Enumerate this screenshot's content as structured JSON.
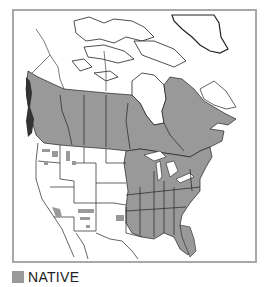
{
  "map": {
    "title": "",
    "region": "North America",
    "fill_color": "#999999",
    "line_color": "#222222",
    "frame_color": "#a8a8a8"
  },
  "legend": {
    "items": [
      {
        "label": "NATIVE",
        "color": "#999999"
      }
    ]
  }
}
